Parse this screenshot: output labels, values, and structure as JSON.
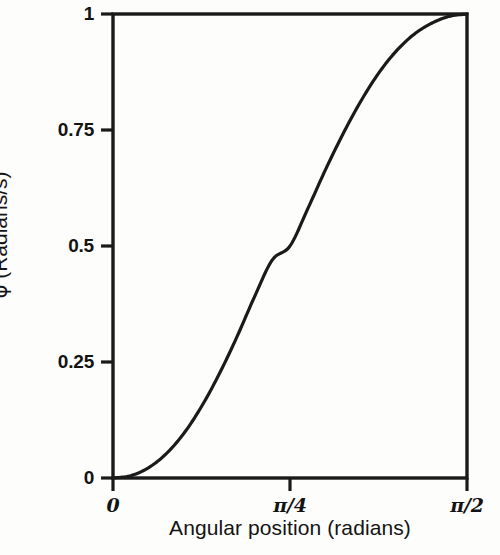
{
  "chart_data": {
    "type": "line",
    "title": "",
    "subtitle": "",
    "xlabel": "Angular position (radians)",
    "ylabel_symbol": "φ",
    "ylabel_text": " (Radians/s)",
    "ylabel_full": "φ̇ (Radians/s)",
    "x_tick_labels": [
      "0",
      "π/4",
      "π/2"
    ],
    "x_tick_values": [
      0,
      0.7853981634,
      1.5707963268
    ],
    "y_tick_labels": [
      "0",
      "0.25",
      "0.5",
      "0.75",
      "1"
    ],
    "y_tick_values": [
      0,
      0.25,
      0.5,
      0.75,
      1
    ],
    "xlim": [
      0,
      1.5707963268
    ],
    "ylim": [
      0,
      1
    ],
    "grid": false,
    "legend": null,
    "series": [
      {
        "name": "angular velocity profile",
        "color": "#1a1a1a",
        "line_width": 3.2,
        "x": [
          0.0,
          0.0785,
          0.1571,
          0.2356,
          0.3142,
          0.3927,
          0.4712,
          0.5498,
          0.6283,
          0.7069,
          0.7854,
          0.8639,
          0.9425,
          1.021,
          1.0996,
          1.1781,
          1.2566,
          1.3352,
          1.4137,
          1.4923,
          1.5708
        ],
        "y": [
          0.0,
          0.005,
          0.022,
          0.052,
          0.096,
          0.154,
          0.224,
          0.304,
          0.391,
          0.47,
          0.5,
          0.58,
          0.664,
          0.742,
          0.812,
          0.872,
          0.92,
          0.956,
          0.98,
          0.995,
          1.0
        ]
      }
    ]
  },
  "axes": {
    "frame_color": "#1a1a1a",
    "background": "#fdfdfc",
    "tick_direction": "out",
    "top_spine": true,
    "right_spine": true
  }
}
